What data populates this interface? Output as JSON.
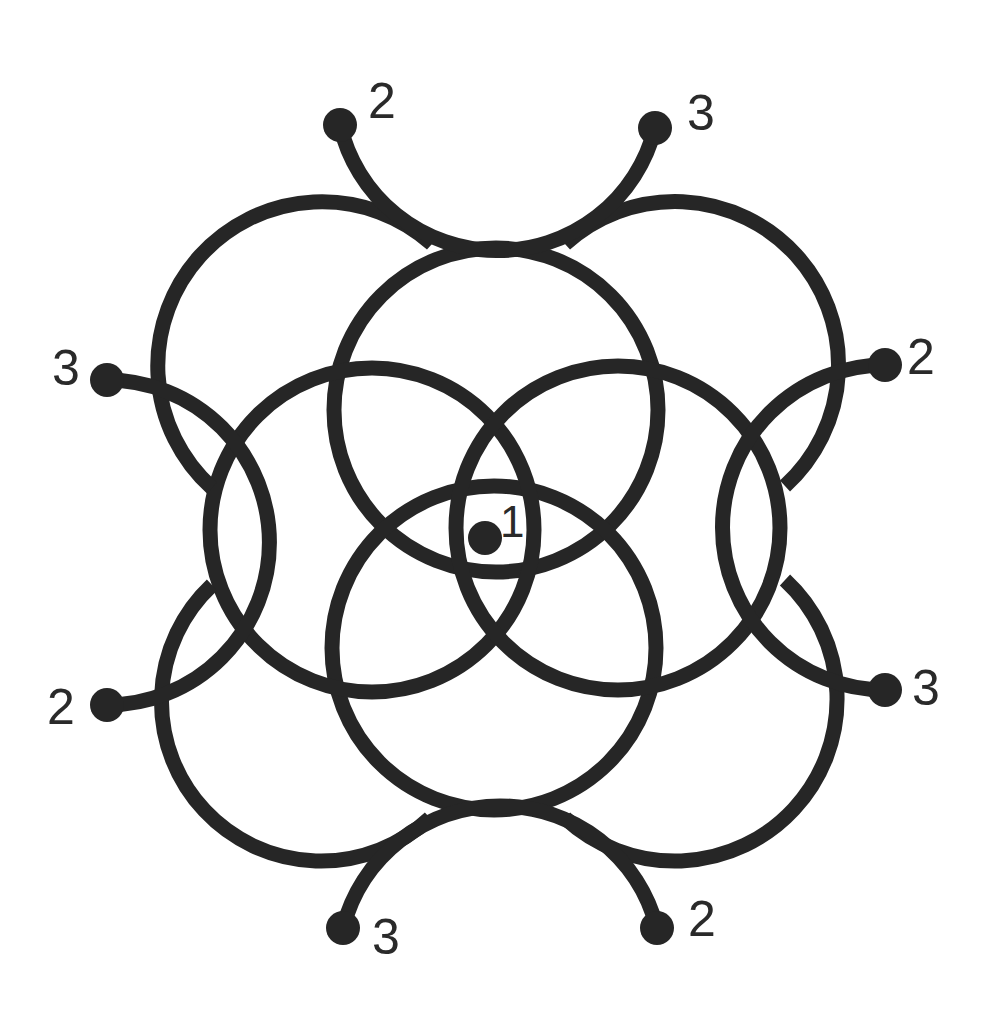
{
  "diagram": {
    "type": "circular maze / overlapping circles puzzle",
    "colors": {
      "stroke": "#262626",
      "background": "#ffffff",
      "label": "#2a2a2a"
    },
    "start": {
      "label": "1",
      "x": 485,
      "y": 538
    },
    "endpoints": [
      {
        "id": "top-left",
        "label": "2",
        "x": 340,
        "y": 125
      },
      {
        "id": "top-right",
        "label": "3",
        "x": 655,
        "y": 128
      },
      {
        "id": "right-top",
        "label": "2",
        "x": 885,
        "y": 365
      },
      {
        "id": "right-bottom",
        "label": "3",
        "x": 885,
        "y": 690
      },
      {
        "id": "bottom-right",
        "label": "2",
        "x": 657,
        "y": 928
      },
      {
        "id": "bottom-left",
        "label": "3",
        "x": 343,
        "y": 928
      },
      {
        "id": "left-bottom",
        "label": "2",
        "x": 107,
        "y": 705
      },
      {
        "id": "left-top",
        "label": "3",
        "x": 107,
        "y": 380
      }
    ]
  }
}
